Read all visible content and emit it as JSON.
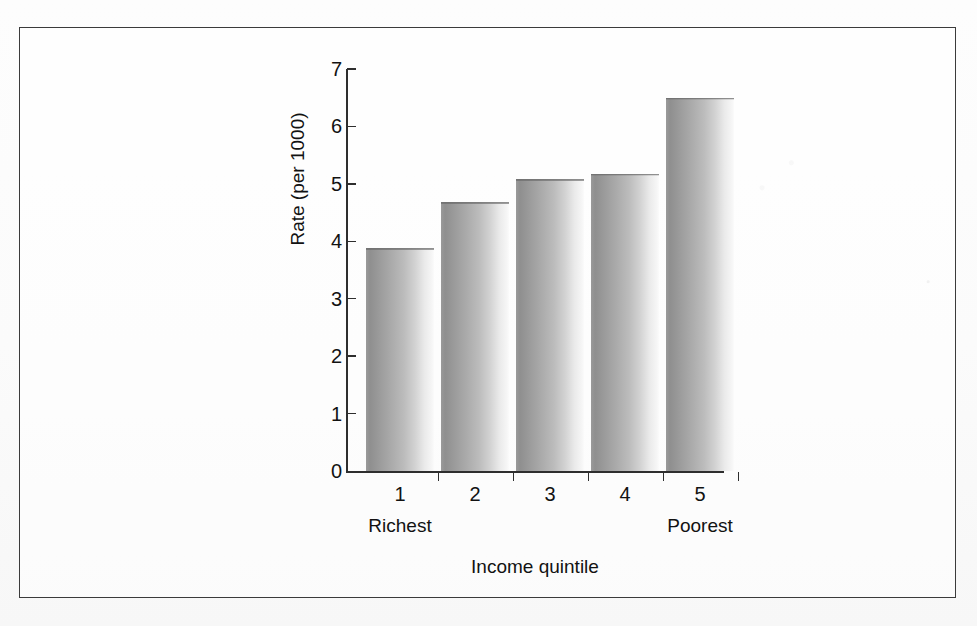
{
  "figure": {
    "frame_color": "#3b3b3b",
    "background_color": "#fbfbfb"
  },
  "chart_data": {
    "type": "bar",
    "title": "",
    "subtitle": "",
    "categories": [
      "1",
      "2",
      "3",
      "4",
      "5"
    ],
    "category_sublabels": [
      "Richest",
      "",
      "",
      "",
      "Poorest"
    ],
    "values": [
      3.88,
      4.68,
      5.08,
      5.18,
      6.5
    ],
    "xlabel": "Income quintile",
    "ylabel": "Rate (per 1000)",
    "ylim": [
      0,
      7
    ],
    "ytick_labels": [
      "0",
      "1",
      "2",
      "3",
      "4",
      "5",
      "6",
      "7"
    ],
    "ytick_values": [
      0,
      1,
      2,
      3,
      4,
      5,
      6,
      7
    ],
    "grid": false,
    "legend": false,
    "bar_color_dark": "#8f8f8f",
    "bar_color_light": "#f6f6f6",
    "axis_color": "#2e2e2e"
  }
}
